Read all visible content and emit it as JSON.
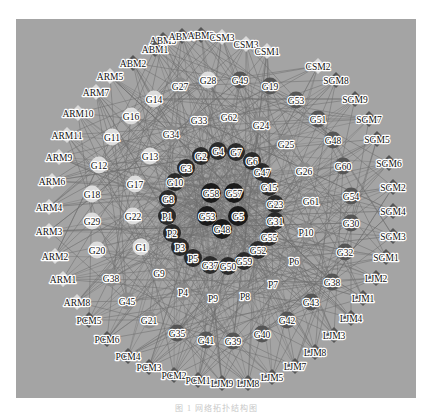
{
  "figure": {
    "caption": "图 1 网络拓扑结构图",
    "colors": {
      "background": "#a4a4a4",
      "edge": "#6e6e6e",
      "module_dark": "#555555",
      "module_light": "#d9d9d9",
      "core": "#1a1a1a",
      "ring": "#2a2a2a",
      "gene_light": "#dcdcdc",
      "gene_mid": "#8a8a8a",
      "gene_dark": "#555555"
    },
    "nodes": [
      {
        "id": "ABM5",
        "x": 163,
        "y": 40,
        "shape": "diamond",
        "tone": "module_dark"
      },
      {
        "id": "ABM4",
        "x": 182,
        "y": 36,
        "shape": "diamond",
        "tone": "module_dark"
      },
      {
        "id": "ABM3",
        "x": 201,
        "y": 35,
        "shape": "diamond",
        "tone": "module_dark"
      },
      {
        "id": "CSM3",
        "x": 222,
        "y": 37,
        "shape": "diamond",
        "tone": "module_light"
      },
      {
        "id": "CSM3",
        "x": 246,
        "y": 44,
        "shape": "diamond",
        "tone": "module_light"
      },
      {
        "id": "CSM1",
        "x": 267,
        "y": 51,
        "shape": "diamond",
        "tone": "module_light"
      },
      {
        "id": "ABM1",
        "x": 155,
        "y": 49,
        "shape": "diamond",
        "tone": "module_dark"
      },
      {
        "id": "ABM2",
        "x": 133,
        "y": 63,
        "shape": "diamond",
        "tone": "module_dark"
      },
      {
        "id": "ARM5",
        "x": 110,
        "y": 76,
        "shape": "diamond",
        "tone": "module_light"
      },
      {
        "id": "ARM7",
        "x": 96,
        "y": 92,
        "shape": "diamond",
        "tone": "module_light"
      },
      {
        "id": "ARM10",
        "x": 78,
        "y": 113,
        "shape": "diamond",
        "tone": "module_light"
      },
      {
        "id": "ARM11",
        "x": 67,
        "y": 135,
        "shape": "diamond",
        "tone": "module_light"
      },
      {
        "id": "ARM9",
        "x": 59,
        "y": 157,
        "shape": "diamond",
        "tone": "module_light"
      },
      {
        "id": "ARM6",
        "x": 52,
        "y": 181,
        "shape": "diamond",
        "tone": "module_light"
      },
      {
        "id": "ARM4",
        "x": 49,
        "y": 207,
        "shape": "diamond",
        "tone": "module_light"
      },
      {
        "id": "ARM3",
        "x": 49,
        "y": 231,
        "shape": "diamond",
        "tone": "module_light"
      },
      {
        "id": "ARM2",
        "x": 55,
        "y": 256,
        "shape": "diamond",
        "tone": "module_light"
      },
      {
        "id": "ARM1",
        "x": 63,
        "y": 279,
        "shape": "diamond",
        "tone": "module_light"
      },
      {
        "id": "ARM8",
        "x": 77,
        "y": 302,
        "shape": "diamond",
        "tone": "module_light"
      },
      {
        "id": "PCM5",
        "x": 89,
        "y": 320,
        "shape": "diamond",
        "tone": "module_dark"
      },
      {
        "id": "PCM6",
        "x": 107,
        "y": 339,
        "shape": "diamond",
        "tone": "module_dark"
      },
      {
        "id": "PCM4",
        "x": 128,
        "y": 356,
        "shape": "diamond",
        "tone": "module_dark"
      },
      {
        "id": "PCM3",
        "x": 149,
        "y": 367,
        "shape": "diamond",
        "tone": "module_dark"
      },
      {
        "id": "PCM2",
        "x": 174,
        "y": 375,
        "shape": "diamond",
        "tone": "module_dark"
      },
      {
        "id": "PCM1",
        "x": 198,
        "y": 380,
        "shape": "diamond",
        "tone": "module_dark"
      },
      {
        "id": "LJM9",
        "x": 222,
        "y": 383,
        "shape": "diamond",
        "tone": "module_dark"
      },
      {
        "id": "LJM8",
        "x": 248,
        "y": 383,
        "shape": "diamond",
        "tone": "module_dark"
      },
      {
        "id": "LJM5",
        "x": 272,
        "y": 377,
        "shape": "diamond",
        "tone": "module_dark"
      },
      {
        "id": "LJM7",
        "x": 295,
        "y": 366,
        "shape": "diamond",
        "tone": "module_dark"
      },
      {
        "id": "LJM8",
        "x": 315,
        "y": 352,
        "shape": "diamond",
        "tone": "module_dark"
      },
      {
        "id": "LJM3",
        "x": 334,
        "y": 335,
        "shape": "diamond",
        "tone": "module_dark"
      },
      {
        "id": "LJM4",
        "x": 351,
        "y": 318,
        "shape": "diamond",
        "tone": "module_dark"
      },
      {
        "id": "LJM1",
        "x": 363,
        "y": 298,
        "shape": "diamond",
        "tone": "module_dark"
      },
      {
        "id": "LJM2",
        "x": 376,
        "y": 278,
        "shape": "diamond",
        "tone": "module_dark"
      },
      {
        "id": "SGM1",
        "x": 386,
        "y": 257,
        "shape": "diamond",
        "tone": "module_dark"
      },
      {
        "id": "SGM3",
        "x": 393,
        "y": 236,
        "shape": "diamond",
        "tone": "module_dark"
      },
      {
        "id": "SGM4",
        "x": 393,
        "y": 211,
        "shape": "diamond",
        "tone": "module_dark"
      },
      {
        "id": "SGM2",
        "x": 393,
        "y": 187,
        "shape": "diamond",
        "tone": "module_dark"
      },
      {
        "id": "SGM6",
        "x": 389,
        "y": 163,
        "shape": "diamond",
        "tone": "module_dark"
      },
      {
        "id": "SGM5",
        "x": 377,
        "y": 139,
        "shape": "diamond",
        "tone": "module_dark"
      },
      {
        "id": "SGM7",
        "x": 369,
        "y": 119,
        "shape": "diamond",
        "tone": "module_dark"
      },
      {
        "id": "SGM9",
        "x": 355,
        "y": 99,
        "shape": "diamond",
        "tone": "module_dark"
      },
      {
        "id": "SGM8",
        "x": 336,
        "y": 80,
        "shape": "diamond",
        "tone": "module_dark"
      },
      {
        "id": "CSM2",
        "x": 318,
        "y": 66,
        "shape": "diamond",
        "tone": "module_light"
      },
      {
        "id": "G27",
        "x": 180,
        "y": 86,
        "tone": "gene_mid"
      },
      {
        "id": "G28",
        "x": 208,
        "y": 80,
        "tone": "gene_light"
      },
      {
        "id": "G49",
        "x": 240,
        "y": 80,
        "tone": "gene_dark"
      },
      {
        "id": "G19",
        "x": 270,
        "y": 86,
        "tone": "gene_dark"
      },
      {
        "id": "G14",
        "x": 154,
        "y": 99,
        "tone": "gene_light"
      },
      {
        "id": "G16",
        "x": 131,
        "y": 116,
        "tone": "gene_light"
      },
      {
        "id": "G11",
        "x": 112,
        "y": 137,
        "tone": "gene_light"
      },
      {
        "id": "G12",
        "x": 99,
        "y": 165,
        "tone": "gene_light"
      },
      {
        "id": "G18",
        "x": 92,
        "y": 194,
        "tone": "gene_light"
      },
      {
        "id": "G29",
        "x": 92,
        "y": 221,
        "tone": "gene_light"
      },
      {
        "id": "G20",
        "x": 97,
        "y": 250,
        "tone": "gene_light"
      },
      {
        "id": "G38",
        "x": 111,
        "y": 278,
        "tone": "gene_mid"
      },
      {
        "id": "G45",
        "x": 127,
        "y": 301,
        "tone": "gene_mid"
      },
      {
        "id": "G21",
        "x": 149,
        "y": 320,
        "tone": "gene_mid"
      },
      {
        "id": "G35",
        "x": 177,
        "y": 333,
        "tone": "gene_dark"
      },
      {
        "id": "G41",
        "x": 206,
        "y": 340,
        "tone": "gene_dark"
      },
      {
        "id": "G39",
        "x": 233,
        "y": 341,
        "tone": "gene_dark"
      },
      {
        "id": "G40",
        "x": 262,
        "y": 334,
        "tone": "gene_dark"
      },
      {
        "id": "G42",
        "x": 287,
        "y": 320,
        "tone": "gene_dark"
      },
      {
        "id": "G43",
        "x": 311,
        "y": 302,
        "tone": "gene_dark"
      },
      {
        "id": "G38",
        "x": 332,
        "y": 282,
        "tone": "gene_dark"
      },
      {
        "id": "G32",
        "x": 345,
        "y": 252,
        "tone": "gene_dark"
      },
      {
        "id": "G30",
        "x": 351,
        "y": 223,
        "tone": "gene_dark"
      },
      {
        "id": "G54",
        "x": 351,
        "y": 196,
        "tone": "gene_dark"
      },
      {
        "id": "G60",
        "x": 343,
        "y": 166,
        "tone": "gene_dark"
      },
      {
        "id": "G48",
        "x": 333,
        "y": 140,
        "tone": "gene_dark"
      },
      {
        "id": "G51",
        "x": 318,
        "y": 119,
        "tone": "gene_dark"
      },
      {
        "id": "G53",
        "x": 296,
        "y": 100,
        "tone": "gene_dark"
      },
      {
        "id": "G33",
        "x": 199,
        "y": 120,
        "tone": "gene_mid"
      },
      {
        "id": "G62",
        "x": 229,
        "y": 117,
        "tone": "gene_mid"
      },
      {
        "id": "G24",
        "x": 261,
        "y": 125,
        "tone": "gene_mid"
      },
      {
        "id": "G34",
        "x": 171,
        "y": 134,
        "tone": "gene_mid"
      },
      {
        "id": "G25",
        "x": 286,
        "y": 144,
        "tone": "gene_mid"
      },
      {
        "id": "G13",
        "x": 150,
        "y": 156,
        "tone": "gene_light"
      },
      {
        "id": "G26",
        "x": 304,
        "y": 171,
        "tone": "gene_mid"
      },
      {
        "id": "G17",
        "x": 135,
        "y": 184,
        "tone": "gene_light"
      },
      {
        "id": "G61",
        "x": 311,
        "y": 201,
        "tone": "gene_mid"
      },
      {
        "id": "G22",
        "x": 133,
        "y": 216,
        "tone": "gene_light"
      },
      {
        "id": "P10",
        "x": 306,
        "y": 232,
        "tone": "gene_mid"
      },
      {
        "id": "G1",
        "x": 141,
        "y": 247,
        "tone": "gene_light"
      },
      {
        "id": "P6",
        "x": 294,
        "y": 261,
        "tone": "gene_mid"
      },
      {
        "id": "G9",
        "x": 159,
        "y": 273,
        "tone": "gene_mid"
      },
      {
        "id": "P7",
        "x": 273,
        "y": 284,
        "tone": "gene_mid"
      },
      {
        "id": "P4",
        "x": 183,
        "y": 292,
        "tone": "gene_mid"
      },
      {
        "id": "P9",
        "x": 213,
        "y": 298,
        "tone": "gene_mid"
      },
      {
        "id": "P8",
        "x": 245,
        "y": 296,
        "tone": "gene_mid"
      },
      {
        "id": "G2",
        "x": 201,
        "y": 156,
        "tone": "ring"
      },
      {
        "id": "G4",
        "x": 218,
        "y": 151,
        "tone": "ring"
      },
      {
        "id": "G7",
        "x": 236,
        "y": 152,
        "tone": "ring"
      },
      {
        "id": "G6",
        "x": 252,
        "y": 161,
        "tone": "ring"
      },
      {
        "id": "G47",
        "x": 262,
        "y": 172,
        "tone": "ring"
      },
      {
        "id": "G15",
        "x": 269,
        "y": 187,
        "tone": "ring"
      },
      {
        "id": "G23",
        "x": 275,
        "y": 204,
        "tone": "ring"
      },
      {
        "id": "G31",
        "x": 275,
        "y": 221,
        "tone": "ring"
      },
      {
        "id": "G55",
        "x": 269,
        "y": 237,
        "tone": "ring"
      },
      {
        "id": "G52",
        "x": 258,
        "y": 250,
        "tone": "ring"
      },
      {
        "id": "G59",
        "x": 244,
        "y": 261,
        "tone": "ring"
      },
      {
        "id": "G50",
        "x": 228,
        "y": 266,
        "tone": "ring"
      },
      {
        "id": "G37",
        "x": 210,
        "y": 265,
        "tone": "ring"
      },
      {
        "id": "P5",
        "x": 193,
        "y": 258,
        "tone": "ring"
      },
      {
        "id": "P3",
        "x": 180,
        "y": 247,
        "tone": "ring"
      },
      {
        "id": "P2",
        "x": 172,
        "y": 233,
        "tone": "ring"
      },
      {
        "id": "P1",
        "x": 167,
        "y": 216,
        "tone": "ring"
      },
      {
        "id": "G8",
        "x": 168,
        "y": 199,
        "tone": "ring"
      },
      {
        "id": "G10",
        "x": 175,
        "y": 182,
        "tone": "ring"
      },
      {
        "id": "G3",
        "x": 186,
        "y": 168,
        "tone": "ring"
      },
      {
        "id": "G58",
        "x": 211,
        "y": 193,
        "tone": "core"
      },
      {
        "id": "G57",
        "x": 234,
        "y": 193,
        "tone": "core"
      },
      {
        "id": "G53",
        "x": 207,
        "y": 216,
        "tone": "core"
      },
      {
        "id": "G5",
        "x": 238,
        "y": 216,
        "tone": "core"
      },
      {
        "id": "G48",
        "x": 222,
        "y": 229,
        "tone": "core"
      }
    ]
  }
}
